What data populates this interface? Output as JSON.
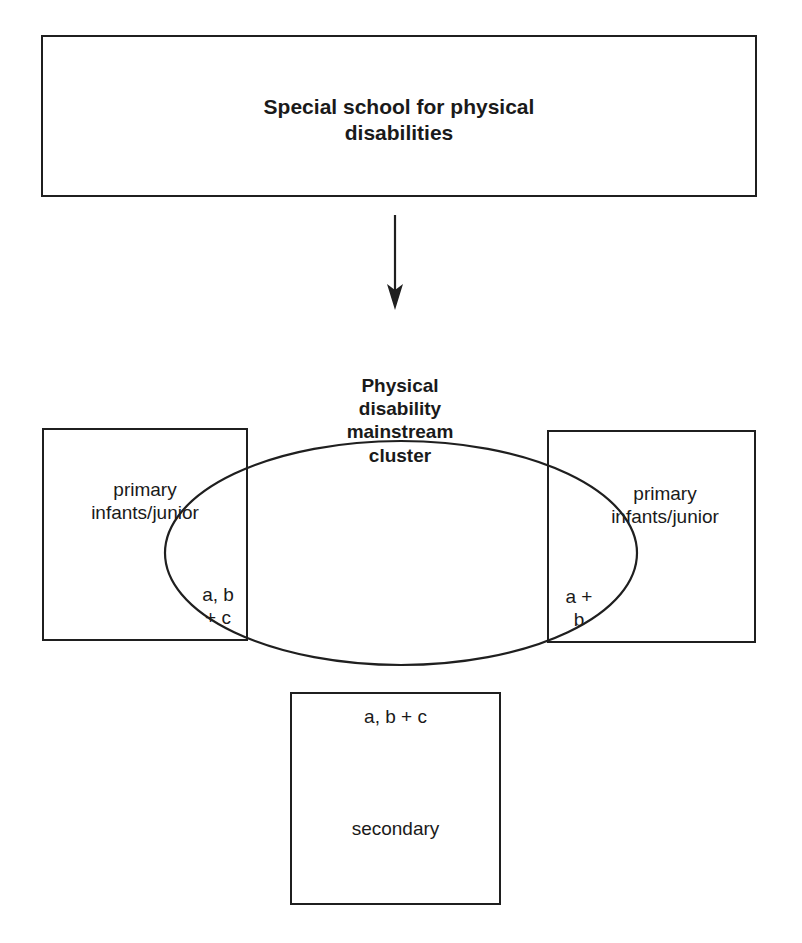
{
  "diagram": {
    "type": "flow-with-cluster",
    "source": {
      "label": "Special school for physical\ndisabilities"
    },
    "arrow": {
      "direction": "down",
      "from": "source",
      "to": "cluster"
    },
    "cluster": {
      "label": "Physical\ndisability\nmainstream\ncluster"
    },
    "schools": [
      {
        "id": "left",
        "label": "primary\ninfants/junior",
        "overlap_label": "a, b\n+ c"
      },
      {
        "id": "right",
        "label": "primary\ninfants/junior",
        "overlap_label": "a +\nb"
      },
      {
        "id": "bottom",
        "label": "secondary",
        "overlap_label": "a, b + c"
      }
    ],
    "colors": {
      "stroke": "#1f1f1f",
      "background": "#ffffff",
      "text": "#1a1a1a"
    }
  }
}
